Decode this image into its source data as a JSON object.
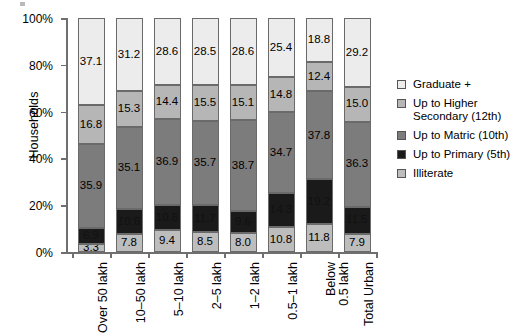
{
  "chart_data": {
    "type": "bar",
    "stacked": true,
    "stack_mode": "percent",
    "title": "",
    "xlabel": "",
    "ylabel": "Households",
    "ylim": [
      0,
      100
    ],
    "ytick_labels": [
      "0%",
      "20%",
      "40%",
      "60%",
      "80%",
      "100%"
    ],
    "ytick_values": [
      0,
      20,
      40,
      60,
      80,
      100
    ],
    "grid": false,
    "legend_position": "right",
    "categories": [
      "Over 50 lakh",
      "10–50 lakh",
      "5–10 lakh",
      "2–5 lakh",
      "1–2 lakh",
      "0.5–1 lakh",
      "Below\n0.5 lakh",
      "Total Urban"
    ],
    "series": [
      {
        "name": "Illiterate",
        "color": "#bdbdbd",
        "values": [
          3.3,
          7.8,
          9.4,
          8.5,
          8.0,
          10.8,
          11.8,
          7.9
        ]
      },
      {
        "name": "Up to Primary (5th)",
        "color": "#1a1a1a",
        "values": [
          6.9,
          10.6,
          10.6,
          11.7,
          9.6,
          14.3,
          19.2,
          11.5
        ]
      },
      {
        "name": "Up to Matric (10th)",
        "color": "#7c7c7c",
        "values": [
          35.9,
          35.1,
          36.9,
          35.7,
          38.7,
          34.7,
          37.8,
          36.3
        ]
      },
      {
        "name": "Up to Higher Secondary (12th)",
        "color": "#b6b6b6",
        "values": [
          16.8,
          15.3,
          14.4,
          15.5,
          15.1,
          14.8,
          12.4,
          15.0
        ]
      },
      {
        "name": "Graduate +",
        "color": "#ececec",
        "values": [
          37.1,
          31.2,
          28.6,
          28.5,
          28.6,
          25.4,
          18.8,
          29.2
        ]
      }
    ],
    "legend_entries": [
      {
        "label": "Graduate +",
        "color": "#ececec"
      },
      {
        "label": "Up to Higher\nSecondary (12th)",
        "color": "#b6b6b6"
      },
      {
        "label": "Up to Matric (10th)",
        "color": "#7c7c7c"
      },
      {
        "label": "Up to Primary (5th)",
        "color": "#1a1a1a"
      },
      {
        "label": "Illiterate",
        "color": "#bdbdbd"
      }
    ]
  },
  "axis": {
    "y_title": "Households"
  },
  "colors": {
    "axis": "#6f6f6f",
    "segment_border": "#6a6a6a",
    "label_dark": "#000000",
    "label_light": "#ffffff"
  }
}
